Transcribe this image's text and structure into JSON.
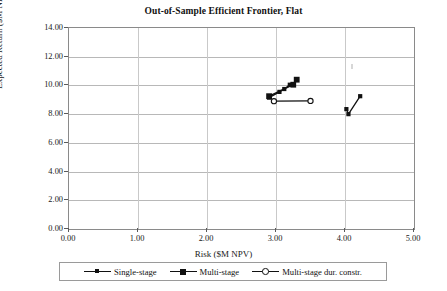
{
  "chart": {
    "title": "Out-of-Sample Efficient Frontier, Flat",
    "xlabel": "Risk ($M NPV)",
    "ylabel": "Expected Return ($M NPV)"
  },
  "axes": {
    "x_ticks": [
      "0.00",
      "1.00",
      "2.00",
      "3.00",
      "4.00",
      "5.00"
    ],
    "y_ticks": [
      "0.00",
      "2.00",
      "4.00",
      "6.00",
      "8.00",
      "10.00",
      "12.00",
      "14.00"
    ]
  },
  "legend": {
    "items": [
      {
        "label": "Single-stage",
        "marker": "filled-diamond-small",
        "color": "#111111"
      },
      {
        "label": "Multi-stage",
        "marker": "filled-square",
        "color": "#111111"
      },
      {
        "label": "Multi-stage dur. constr.",
        "marker": "open-circle",
        "color": "#111111"
      }
    ]
  },
  "chart_data": {
    "type": "scatter",
    "title": "Out-of-Sample Efficient Frontier, Flat",
    "xlabel": "Risk ($M NPV)",
    "ylabel": "Expected Return ($M NPV)",
    "xlim": [
      0.0,
      5.0
    ],
    "ylim": [
      0.0,
      14.0
    ],
    "xticks": [
      0.0,
      1.0,
      2.0,
      3.0,
      4.0,
      5.0
    ],
    "yticks": [
      0.0,
      2.0,
      4.0,
      6.0,
      8.0,
      10.0,
      12.0,
      14.0
    ],
    "grid": true,
    "legend_position": "below-axes",
    "series": [
      {
        "name": "Single-stage",
        "marker": "filled-diamond-small",
        "color": "#111111",
        "segments": [
          {
            "x": [
              2.9,
              3.05,
              3.12,
              3.2
            ],
            "y": [
              9.15,
              9.55,
              9.75,
              10.05
            ]
          },
          {
            "x": [
              4.02,
              4.05,
              4.22
            ],
            "y": [
              8.35,
              8.0,
              9.25
            ]
          }
        ]
      },
      {
        "name": "Multi-stage",
        "marker": "filled-square",
        "color": "#111111",
        "segments": [
          {
            "x": [
              2.9,
              3.25,
              3.3
            ],
            "y": [
              9.25,
              10.05,
              10.4
            ]
          }
        ]
      },
      {
        "name": "Multi-stage dur. constr.",
        "marker": "open-circle",
        "color": "#111111",
        "segments": [
          {
            "x": [
              2.97,
              3.5
            ],
            "y": [
              8.9,
              8.92
            ]
          }
        ]
      }
    ]
  }
}
